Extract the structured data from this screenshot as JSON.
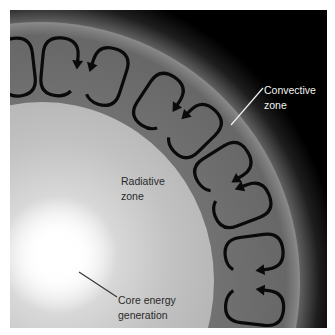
{
  "figure": {
    "colors": {
      "background": "#000000",
      "convective_zone": "#6b6b6b",
      "radiative_zone": "#b8b8b8",
      "core_glow": "#ffffff",
      "arrow": "#0a0a0a"
    },
    "regions": [
      {
        "id": "core",
        "label": "Core energy generation"
      },
      {
        "id": "radiative",
        "label": "Radiative zone"
      },
      {
        "id": "convective",
        "label": "Convective zone"
      }
    ],
    "convection_cells": [
      {
        "angle": -96.4,
        "mirrored": true
      },
      {
        "angle": -84.7,
        "mirrored": false
      },
      {
        "angle": -72.2,
        "mirrored": true
      },
      {
        "angle": -56.6,
        "mirrored": false
      },
      {
        "angle": -44.5,
        "mirrored": true
      },
      {
        "angle": -32.0,
        "mirrored": false
      },
      {
        "angle": -20.9,
        "mirrored": true
      },
      {
        "angle": -7.5,
        "mirrored": false
      },
      {
        "angle": 6.4,
        "mirrored": true
      },
      {
        "angle": 19.5,
        "mirrored": false
      }
    ]
  },
  "labels": {
    "convective": {
      "line1": "Convective",
      "line2": "zone"
    },
    "radiative": {
      "line1": "Radiative",
      "line2": "zone"
    },
    "core": {
      "line1": "Core energy",
      "line2": "generation"
    }
  }
}
